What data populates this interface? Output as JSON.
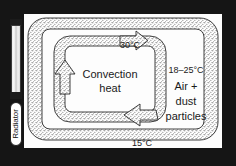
{
  "diagram": {
    "frame_color": "#151515",
    "panel_color": "#fdfdfd",
    "ink_color": "#1a1a1a"
  },
  "radiator": {
    "label": "Radiator",
    "icon": "radiator-panel-icon",
    "heat_marks_icon": "heat-chevrons-icon"
  },
  "labels": {
    "top_temperature": "30°C",
    "bottom_temperature": "15°C",
    "convection_line1": "Convection",
    "convection_line2": "heat",
    "air_temperature_range": "18–25°C",
    "air_line1": "Air +",
    "air_line2": "dust",
    "air_line3": "particles"
  },
  "flow": {
    "outer_loop_name": "outer-circulation-loop",
    "inner_loop_name": "inner-circulation-loop",
    "arrows": [
      {
        "name": "arrow-top-right",
        "direction": "right"
      },
      {
        "name": "arrow-bottom-left",
        "direction": "left"
      },
      {
        "name": "arrow-inner-up",
        "direction": "up"
      }
    ]
  }
}
